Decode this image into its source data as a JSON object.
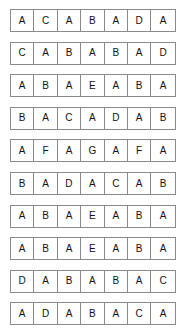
{
  "document": {
    "type": "letter-grid-sheet",
    "row_count": 10,
    "columns_per_row": 7,
    "alphabet_used": [
      "A",
      "B",
      "C",
      "D",
      "E",
      "F",
      "G"
    ],
    "colors": {
      "page_background": "#ffffff",
      "cell_border": "#8a8a8a",
      "letter_text": "#111111"
    },
    "rows": [
      {
        "index": 1,
        "letters": [
          "A",
          "C",
          "A",
          "B",
          "A",
          "D",
          "A"
        ]
      },
      {
        "index": 2,
        "letters": [
          "C",
          "A",
          "B",
          "A",
          "B",
          "A",
          "D"
        ]
      },
      {
        "index": 3,
        "letters": [
          "A",
          "B",
          "A",
          "E",
          "A",
          "B",
          "A"
        ]
      },
      {
        "index": 4,
        "letters": [
          "B",
          "A",
          "C",
          "A",
          "D",
          "A",
          "B"
        ]
      },
      {
        "index": 5,
        "letters": [
          "A",
          "F",
          "A",
          "G",
          "A",
          "F",
          "A"
        ]
      },
      {
        "index": 6,
        "letters": [
          "B",
          "A",
          "D",
          "A",
          "C",
          "A",
          "B"
        ]
      },
      {
        "index": 7,
        "letters": [
          "A",
          "B",
          "A",
          "E",
          "A",
          "B",
          "A"
        ]
      },
      {
        "index": 8,
        "letters": [
          "A",
          "B",
          "A",
          "E",
          "A",
          "B",
          "A"
        ]
      },
      {
        "index": 9,
        "letters": [
          "D",
          "A",
          "B",
          "A",
          "B",
          "A",
          "C"
        ]
      },
      {
        "index": 10,
        "letters": [
          "A",
          "D",
          "A",
          "B",
          "A",
          "C",
          "A"
        ]
      }
    ]
  }
}
